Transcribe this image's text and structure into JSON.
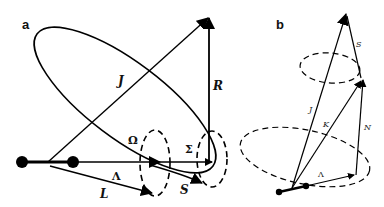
{
  "figure": {
    "panel_a": {
      "label": "a",
      "vectors": {
        "J": "J",
        "R": "R",
        "Omega": "Ω",
        "Sigma": "Σ",
        "Lambda": "Λ",
        "L": "L",
        "S": "S"
      }
    },
    "panel_b": {
      "label": "b",
      "vectors": {
        "S": "S",
        "J": "J",
        "K": "K",
        "N": "N",
        "Lambda": "Λ"
      }
    }
  }
}
